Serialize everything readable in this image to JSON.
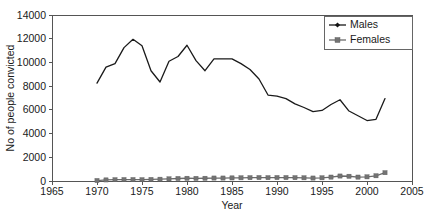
{
  "chart_data": {
    "type": "line",
    "title": "",
    "xlabel": "Year",
    "ylabel": "No of people convicted",
    "xlim": [
      1965,
      2005
    ],
    "ylim": [
      0,
      14000
    ],
    "xticks": [
      1965,
      1970,
      1975,
      1980,
      1985,
      1990,
      1995,
      2000,
      2005
    ],
    "yticks": [
      0,
      2000,
      4000,
      6000,
      8000,
      10000,
      12000,
      14000
    ],
    "grid": false,
    "legend_position": "top-right",
    "x": [
      1970,
      1971,
      1972,
      1973,
      1974,
      1975,
      1976,
      1977,
      1978,
      1979,
      1980,
      1981,
      1982,
      1983,
      1984,
      1985,
      1986,
      1987,
      1988,
      1989,
      1990,
      1991,
      1992,
      1993,
      1994,
      1995,
      1996,
      1997,
      1998,
      1999,
      2000,
      2001,
      2002
    ],
    "series": [
      {
        "name": "Males",
        "marker": "diamond",
        "color": "#141414",
        "values": [
          8250,
          9600,
          9900,
          11250,
          11950,
          11400,
          9300,
          8350,
          10100,
          10500,
          11450,
          10150,
          9300,
          10300,
          10300,
          10300,
          9900,
          9400,
          8600,
          7250,
          7150,
          6950,
          6500,
          6200,
          5850,
          5950,
          6450,
          6850,
          5900,
          5500,
          5100,
          5200,
          6950
        ]
      },
      {
        "name": "Females",
        "marker": "square",
        "color": "#737373",
        "values": [
          40,
          90,
          110,
          120,
          120,
          110,
          130,
          150,
          180,
          210,
          230,
          220,
          230,
          250,
          250,
          260,
          270,
          280,
          290,
          280,
          290,
          290,
          280,
          270,
          250,
          270,
          330,
          420,
          400,
          330,
          350,
          440,
          700
        ]
      }
    ]
  },
  "legend": {
    "entries": [
      {
        "label": "Males"
      },
      {
        "label": "Females"
      }
    ]
  },
  "caption": {
    "text": ""
  }
}
